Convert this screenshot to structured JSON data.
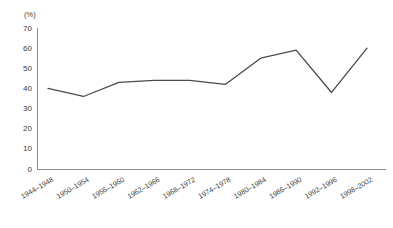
{
  "chart_data": {
    "type": "line",
    "title": "",
    "xlabel": "",
    "ylabel": "",
    "unit_label": "(%)",
    "ylim": [
      0,
      70
    ],
    "ytick_step": 10,
    "yticks": [
      0,
      10,
      20,
      30,
      40,
      50,
      60,
      70
    ],
    "grid": false,
    "legend": "none",
    "line_color": "#4a4a4a",
    "axis_color": "#8a8a8a",
    "categories": [
      "1944–1948",
      "1950–1954",
      "1956–1960",
      "1962–1966",
      "1968–1972",
      "1974–1978",
      "1980–1984",
      "1986–1990",
      "1992–1996",
      "1998–2002"
    ],
    "values": [
      40,
      36,
      43,
      44,
      44,
      42,
      55,
      59,
      38,
      60
    ],
    "series": [
      {
        "name": "",
        "values": [
          40,
          36,
          43,
          44,
          44,
          42,
          55,
          59,
          38,
          60
        ]
      }
    ]
  }
}
